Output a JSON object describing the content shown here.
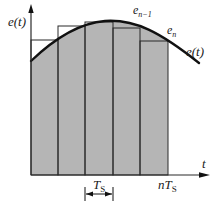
{
  "diagram": {
    "colors": {
      "fill": "#b5b5b5",
      "line": "#2a2a2a",
      "curve": "#111111",
      "background": "#ffffff"
    },
    "axes": {
      "y_label": "e(t)",
      "x_label": "t"
    },
    "curve_label": "e(t)",
    "sample_labels": {
      "e_n_minus_1": {
        "base": "e",
        "sub": "n−1"
      },
      "e_n": {
        "base": "e",
        "sub": "n"
      }
    },
    "period_label": {
      "base": "T",
      "sub": "S"
    },
    "end_label": {
      "prefix": "nT",
      "sub": "S"
    },
    "bars": [
      {
        "x0": 31,
        "x1": 58,
        "top": 40
      },
      {
        "x0": 58,
        "x1": 85,
        "top": 26
      },
      {
        "x0": 85,
        "x1": 113,
        "top": 22
      },
      {
        "x0": 113,
        "x1": 140,
        "top": 28
      },
      {
        "x0": 140,
        "x1": 168,
        "top": 41
      }
    ]
  }
}
